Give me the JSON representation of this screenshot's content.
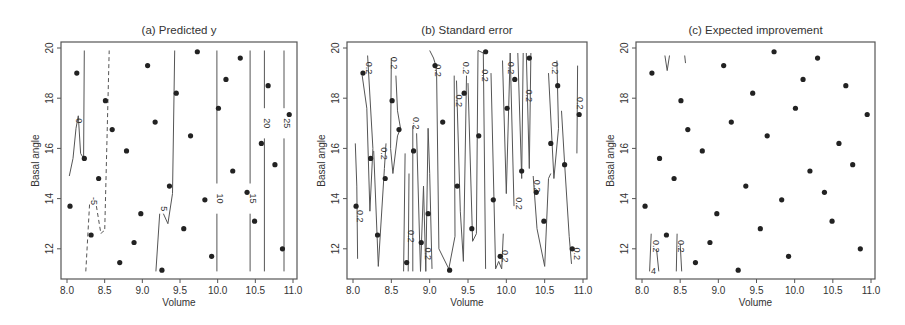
{
  "chart_data": [
    {
      "type": "scatter",
      "subtype": "contour",
      "title": "(a) Predicted y",
      "xlabel": "Volume",
      "ylabel": "Basal angle",
      "xlim": [
        8.0,
        11.0
      ],
      "ylim": [
        11,
        20
      ],
      "xticks": [
        "8.0",
        "8.5",
        "9.0",
        "9.5",
        "10.0",
        "10.5",
        "11.0"
      ],
      "yticks": [
        "12",
        "14",
        "16",
        "18",
        "20"
      ],
      "contour_levels": [
        "-5",
        "0",
        "5",
        "10",
        "15",
        "20",
        "25"
      ],
      "points": [
        [
          8.04,
          13.7
        ],
        [
          8.13,
          19.0
        ],
        [
          8.23,
          15.6
        ],
        [
          8.32,
          12.55
        ],
        [
          8.42,
          14.8
        ],
        [
          8.51,
          17.9
        ],
        [
          8.6,
          16.75
        ],
        [
          8.7,
          11.45
        ],
        [
          8.79,
          15.9
        ],
        [
          8.89,
          12.25
        ],
        [
          8.98,
          13.4
        ],
        [
          9.07,
          19.3
        ],
        [
          9.17,
          17.05
        ],
        [
          9.26,
          11.15
        ],
        [
          9.36,
          14.5
        ],
        [
          9.45,
          18.2
        ],
        [
          9.55,
          12.8
        ],
        [
          9.64,
          16.5
        ],
        [
          9.73,
          19.85
        ],
        [
          9.83,
          13.95
        ],
        [
          9.92,
          11.7
        ],
        [
          10.01,
          17.6
        ],
        [
          10.11,
          18.75
        ],
        [
          10.2,
          15.1
        ],
        [
          10.3,
          19.6
        ],
        [
          10.39,
          14.25
        ],
        [
          10.49,
          13.1
        ],
        [
          10.58,
          16.2
        ],
        [
          10.67,
          18.5
        ],
        [
          10.76,
          15.35
        ],
        [
          10.86,
          12.0
        ],
        [
          10.95,
          17.35
        ]
      ]
    },
    {
      "type": "scatter",
      "subtype": "contour",
      "title": "(b) Standard error",
      "xlabel": "Volume",
      "ylabel": "Basal angle",
      "xlim": [
        8.0,
        11.0
      ],
      "ylim": [
        11,
        20
      ],
      "xticks": [
        "8.0",
        "8.5",
        "9.0",
        "9.5",
        "10.0",
        "10.5",
        "11.0"
      ],
      "yticks": [
        "12",
        "14",
        "16",
        "18",
        "20"
      ],
      "contour_levels": [
        "0.2"
      ],
      "points": "same as (a)"
    },
    {
      "type": "scatter",
      "subtype": "contour",
      "title": "(c) Expected improvement",
      "xlabel": "Volume",
      "ylabel": "Basal angle",
      "xlim": [
        8.0,
        11.0
      ],
      "ylim": [
        11,
        20
      ],
      "xticks": [
        "8.0",
        "8.5",
        "9.0",
        "9.5",
        "10.0",
        "10.5",
        "11.0"
      ],
      "yticks": [
        "12",
        "14",
        "16",
        "18",
        "20"
      ],
      "contour_levels": [
        "0.2",
        "4"
      ],
      "points": "same as (a)"
    }
  ],
  "panels": [
    {
      "title": "(a) Predicted y",
      "x0": 61,
      "x1": 297
    },
    {
      "title": "(b) Standard error",
      "x0": 347,
      "x1": 587
    },
    {
      "title": "(c) Expected improvement",
      "x0": 636,
      "x1": 875
    }
  ],
  "axis": {
    "xlabel": "Volume",
    "ylabel": "Basal angle",
    "xticks": [
      "8.0",
      "8.5",
      "9.0",
      "9.5",
      "10.0",
      "10.5",
      "11.0"
    ],
    "yticks": [
      "12",
      "14",
      "16",
      "18",
      "20"
    ]
  },
  "labels_a": {
    "m5": "-5",
    "z": "0",
    "l5": "5",
    "l10": "10",
    "l15": "15",
    "l20": "20",
    "l25": "25"
  },
  "labels_b": {
    "v": "0.2"
  },
  "labels_c": {
    "v": "0.2",
    "four": "4"
  }
}
